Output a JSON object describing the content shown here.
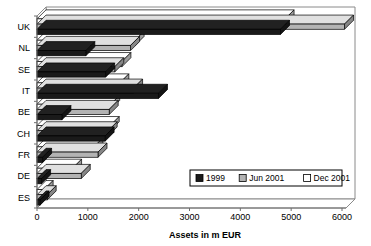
{
  "chart_data": {
    "type": "bar",
    "orientation": "horizontal",
    "title": "",
    "subtitle": "",
    "xlabel": "Assets in m EUR",
    "ylabel": "",
    "xlim": [
      0,
      6000
    ],
    "xticks": [
      0,
      1000,
      2000,
      3000,
      4000,
      5000,
      6000
    ],
    "xtick_labels": [
      "0",
      "1000",
      "2000",
      "3000",
      "4000",
      "5000",
      "6000"
    ],
    "categories": [
      "UK",
      "NL",
      "SE",
      "IT",
      "BE",
      "CH",
      "FR",
      "DE",
      "ES"
    ],
    "grid": false,
    "legend_position": "inside-lower-right",
    "series": [
      {
        "name": "1999",
        "color": "#1a1a1a",
        "values": [
          4790,
          960,
          1350,
          2390,
          490,
          1340,
          110,
          90,
          60
        ]
      },
      {
        "name": "Jun 2001",
        "color": "#b3b3b3",
        "values": [
          6050,
          1840,
          1530,
          1900,
          1420,
          1400,
          1200,
          870,
          200
        ]
      },
      {
        "name": "Dec 2001",
        "color": "#ffffff",
        "values": [
          4880,
          1930,
          1670,
          1630,
          1450,
          1440,
          1120,
          700,
          140
        ]
      }
    ]
  },
  "legend": {
    "items": [
      {
        "label": "1999",
        "color": "#1a1a1a"
      },
      {
        "label": "Jun 2001",
        "color": "#b3b3b3"
      },
      {
        "label": "Dec 2001",
        "color": "#ffffff"
      }
    ]
  },
  "axis": {
    "x_title": "Assets in m EUR"
  }
}
